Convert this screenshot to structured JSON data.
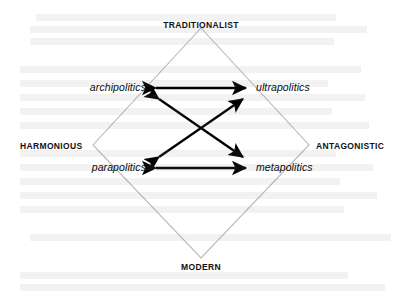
{
  "figure": {
    "kind": "concept-quadrant-diagram",
    "background_color": "#ffffff",
    "ink_color": "#000000",
    "diamond_color": "#b9b9bd"
  },
  "axes": {
    "vertical": {
      "top_label": "TRADITIONALIST",
      "bottom_label": "MODERN"
    },
    "horizontal": {
      "left_label": "HARMONIOUS",
      "right_label": "ANTAGONISTIC"
    }
  },
  "nodes": {
    "top_left": "archipolitics",
    "top_right": "ultrapolitics",
    "bottom_left": "parapolitics",
    "bottom_right": "metapolitics"
  },
  "diamond": {
    "top": {
      "x": 201,
      "y": 28
    },
    "right": {
      "x": 309,
      "y": 145
    },
    "bottom": {
      "x": 201,
      "y": 258
    },
    "left": {
      "x": 93,
      "y": 145
    }
  },
  "connections": [
    {
      "name": "archipolitics-ultrapolitics",
      "from": "top_left",
      "to": "top_right",
      "style": "double-headed",
      "orientation": "horizontal"
    },
    {
      "name": "parapolitics-metapolitics",
      "from": "bottom_left",
      "to": "bottom_right",
      "style": "double-headed",
      "orientation": "horizontal"
    },
    {
      "name": "archipolitics-metapolitics",
      "from": "top_left",
      "to": "bottom_right",
      "style": "double-headed",
      "orientation": "diagonal"
    },
    {
      "name": "parapolitics-ultrapolitics",
      "from": "bottom_left",
      "to": "top_right",
      "style": "double-headed",
      "orientation": "diagonal"
    }
  ],
  "arrow_geometry": {
    "horizontal_top": {
      "x1": 156,
      "y1": 88,
      "x2": 246,
      "y2": 88
    },
    "horizontal_bottom": {
      "x1": 156,
      "y1": 168,
      "x2": 246,
      "y2": 168
    },
    "diagonal_down": {
      "x1": 159,
      "y1": 99,
      "x2": 243,
      "y2": 157
    },
    "diagonal_up": {
      "x1": 159,
      "y1": 157,
      "x2": 243,
      "y2": 99
    }
  },
  "ghost_text": {
    "note": "faint show-through text from reverse page, illegible",
    "lines": [
      {
        "x": 36,
        "y": 14,
        "text": "        "
      },
      {
        "x": 30,
        "y": 26,
        "text": "          "
      },
      {
        "x": 30,
        "y": 38,
        "text": "         "
      },
      {
        "x": 20,
        "y": 66,
        "text": "           "
      },
      {
        "x": 20,
        "y": 80,
        "text": "           "
      },
      {
        "x": 20,
        "y": 94,
        "text": "          "
      },
      {
        "x": 20,
        "y": 108,
        "text": "          "
      },
      {
        "x": 20,
        "y": 122,
        "text": "           "
      },
      {
        "x": 20,
        "y": 150,
        "text": "          "
      },
      {
        "x": 20,
        "y": 164,
        "text": "          "
      },
      {
        "x": 20,
        "y": 178,
        "text": "           "
      },
      {
        "x": 20,
        "y": 192,
        "text": "          "
      },
      {
        "x": 20,
        "y": 206,
        "text": "           "
      },
      {
        "x": 30,
        "y": 234,
        "text": "         "
      },
      {
        "x": 20,
        "y": 272,
        "text": "           "
      },
      {
        "x": 20,
        "y": 284,
        "text": "          "
      }
    ]
  }
}
